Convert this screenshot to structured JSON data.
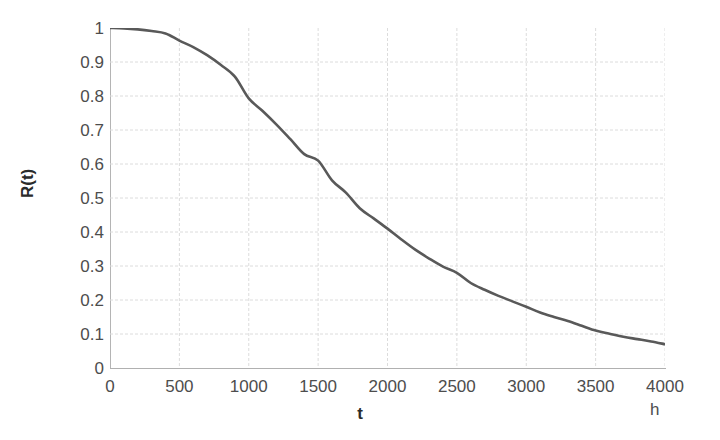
{
  "chart_data": {
    "type": "line",
    "title": "",
    "subtitle": "",
    "xlabel": "t",
    "ylabel": "R(t)",
    "x_unit": "h",
    "xlim": [
      0,
      4000
    ],
    "ylim": [
      0,
      1
    ],
    "grid": true,
    "legend": "none",
    "x_tick_labels": [
      "0",
      "500",
      "1000",
      "1500",
      "2000",
      "2500",
      "3000",
      "3500",
      "4000"
    ],
    "x_ticks": [
      0,
      500,
      1000,
      1500,
      2000,
      2500,
      3000,
      3500,
      4000
    ],
    "y_tick_labels": [
      "1",
      "0.9",
      "0.8",
      "0.7",
      "0.6",
      "0.5",
      "0.4",
      "0.3",
      "0.2",
      "0.1",
      "0"
    ],
    "y_ticks": [
      1,
      0.9,
      0.8,
      0.7,
      0.6,
      0.5,
      0.4,
      0.3,
      0.2,
      0.1,
      0
    ],
    "series": [
      {
        "name": "R(t)",
        "color": "#595959",
        "line_width": 2.6,
        "x": [
          0,
          100,
          200,
          300,
          400,
          500,
          600,
          700,
          800,
          900,
          1000,
          1100,
          1200,
          1300,
          1400,
          1500,
          1600,
          1700,
          1800,
          1900,
          2000,
          2100,
          2200,
          2300,
          2400,
          2500,
          2600,
          2700,
          2800,
          2900,
          3000,
          3100,
          3200,
          3300,
          3400,
          3500,
          3600,
          3700,
          3800,
          3900,
          4000
        ],
        "values": [
          1.0,
          0.999,
          0.996,
          0.991,
          0.984,
          0.963,
          0.944,
          0.92,
          0.891,
          0.857,
          0.793,
          0.756,
          0.716,
          0.673,
          0.629,
          0.61,
          0.552,
          0.516,
          0.47,
          0.44,
          0.41,
          0.378,
          0.348,
          0.322,
          0.298,
          0.28,
          0.25,
          0.23,
          0.212,
          0.196,
          0.18,
          0.163,
          0.15,
          0.138,
          0.124,
          0.11,
          0.101,
          0.092,
          0.085,
          0.078,
          0.07
        ]
      }
    ]
  },
  "axes": {
    "y_title": "R(t)",
    "x_title": "t",
    "x_unit_label": "h"
  },
  "colors": {
    "curve": "#595959",
    "grid": "#dcdcdc",
    "axis": "#b0b0b0",
    "tick_text": "#4d4d4d",
    "title_text": "#2b2b2b",
    "background": "#ffffff"
  }
}
